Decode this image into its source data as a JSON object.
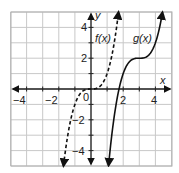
{
  "chart_data": {
    "type": "line",
    "title": "",
    "xlabel": "x",
    "ylabel": "y",
    "xlim": [
      -5,
      5
    ],
    "ylim": [
      -5,
      5
    ],
    "grid": true,
    "x_ticks": [
      -4,
      -2,
      0,
      2,
      4
    ],
    "x_tick_labels": [
      "−4",
      "−2",
      "0",
      "2",
      "4"
    ],
    "y_ticks": [
      -4,
      -2,
      2,
      4
    ],
    "y_tick_labels": [
      "−4",
      "−2",
      "2",
      "4"
    ],
    "origin_label": "0",
    "series": [
      {
        "name": "f(x)",
        "label": "f(x)",
        "style": "dashed",
        "formula": "y = x^3",
        "x": [
          -1.71,
          -1.5,
          -1.0,
          -0.5,
          0,
          0.5,
          1.0,
          1.5,
          1.71
        ],
        "y": [
          -5,
          -3.375,
          -1,
          -0.125,
          0,
          0.125,
          1,
          3.375,
          5
        ],
        "arrows": "both"
      },
      {
        "name": "g(x)",
        "label": "g(x)",
        "style": "solid",
        "formula": "y = (x - 3)^3 + 2",
        "x": [
          1.09,
          1.5,
          2.0,
          2.5,
          3.0,
          3.5,
          4.0,
          4.44
        ],
        "y": [
          -5,
          -1.375,
          1,
          1.875,
          2,
          2.125,
          3,
          5
        ],
        "arrows": "both"
      }
    ],
    "legend": "inline labels"
  },
  "labels": {
    "x_axis": "x",
    "y_axis": "y",
    "f_label": "f(x)",
    "g_label": "g(x)",
    "origin": "0",
    "xt_m4": "−4",
    "xt_m2": "−2",
    "xt_2": "2",
    "xt_4": "4",
    "yt_4": "4",
    "yt_2": "2",
    "yt_m2": "−2",
    "yt_m4": "−4"
  },
  "colors": {
    "grid": "#c8c8c8",
    "axis": "#222222",
    "curve": "#111111",
    "background": "#ffffff"
  }
}
